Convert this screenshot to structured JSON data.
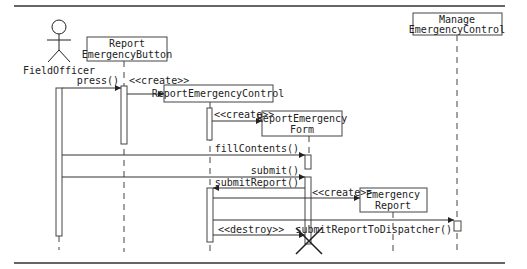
{
  "diagram": {
    "type": "UML sequence diagram",
    "actor": {
      "name": "FieldOfficer"
    },
    "objects": [
      {
        "id": "button",
        "lines": [
          "Report",
          "EmergencyButton"
        ]
      },
      {
        "id": "control",
        "lines": [
          "ReportEmergencyControl"
        ]
      },
      {
        "id": "form",
        "lines": [
          "ReportEmergency",
          "Form"
        ]
      },
      {
        "id": "report",
        "lines": [
          "Emergency",
          "Report"
        ]
      },
      {
        "id": "manage",
        "lines": [
          "Manage",
          "EmergencyControl"
        ]
      }
    ],
    "messages": [
      {
        "from": "FieldOfficer",
        "to": "button",
        "label": "press()"
      },
      {
        "from": "button",
        "to": "control",
        "label": "<<create>>"
      },
      {
        "from": "control",
        "to": "form",
        "label": "<<create>>"
      },
      {
        "from": "FieldOfficer",
        "to": "form",
        "label": "fillContents()"
      },
      {
        "from": "FieldOfficer",
        "to": "form",
        "label": "submit()"
      },
      {
        "from": "form",
        "to": "control",
        "label": "submitReport()"
      },
      {
        "from": "control",
        "to": "report",
        "label": "<<create>>"
      },
      {
        "from": "control",
        "to": "manage",
        "label": "submitReportToDispatcher()"
      },
      {
        "from": "control",
        "to": "form",
        "label": "<<destroy>>"
      }
    ]
  }
}
